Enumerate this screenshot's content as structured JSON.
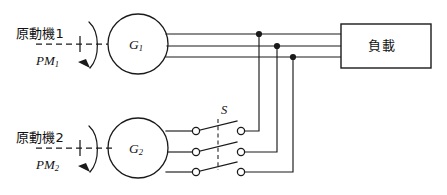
{
  "diagram": {
    "type": "electrical-schematic",
    "line_color": "#1a1a1a",
    "background_color": "#ffffff",
    "phase_count": 3
  },
  "prime_movers": [
    {
      "id": "pm1",
      "label": "原動機1",
      "symbol": "PM",
      "symbol_subscript": "1",
      "rotation_arrow": "clockwise-arc-arrow",
      "shaft_style": "dash-dot-centerline"
    },
    {
      "id": "pm2",
      "label": "原動機2",
      "symbol": "PM",
      "symbol_subscript": "2",
      "rotation_arrow": "clockwise-arc-arrow",
      "shaft_style": "dash-dot-centerline"
    }
  ],
  "generators": [
    {
      "id": "g1",
      "symbol": "G",
      "symbol_subscript": "1",
      "shape": "circle",
      "connected_to": "bus-direct"
    },
    {
      "id": "g2",
      "symbol": "G",
      "symbol_subscript": "2",
      "shape": "circle",
      "connected_to": "switch-S"
    }
  ],
  "switch": {
    "id": "s1",
    "label": "S",
    "poles": 3,
    "state": "open",
    "ganged": true,
    "contact_style": "open-circle-terminals"
  },
  "load": {
    "label": "負載",
    "shape": "rectangle"
  },
  "bus": {
    "conductors": 3,
    "junction_label": "bus-tie-node",
    "junction_count": 3
  }
}
